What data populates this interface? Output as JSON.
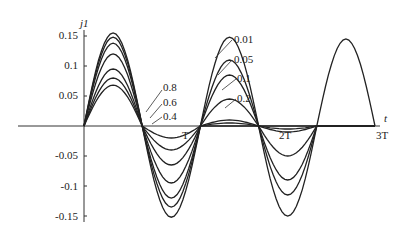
{
  "chart_data": {
    "type": "line",
    "title": "",
    "xlabel": "t",
    "ylabel": "j1",
    "x_ticks": [
      "T",
      "2T",
      "3T"
    ],
    "y_ticks": [
      "0.15",
      "0.1",
      "0.05",
      "-0.05",
      "-0.1",
      "-0.15"
    ],
    "ylim": [
      -0.16,
      0.16
    ],
    "grid": false,
    "legend_position": "inline annotations",
    "series": [
      {
        "name": "0.01",
        "peaks": [
          0.155,
          -0.152,
          0.148,
          -0.15,
          0.145
        ]
      },
      {
        "name": "0.05",
        "peaks": [
          0.148,
          -0.135,
          0.11,
          -0.115,
          0.0
        ]
      },
      {
        "name": "0.1",
        "peaks": [
          0.138,
          -0.12,
          0.085,
          -0.09,
          0.0
        ]
      },
      {
        "name": "0.2",
        "peaks": [
          0.12,
          -0.095,
          0.045,
          -0.05,
          0.0
        ]
      },
      {
        "name": "0.4",
        "peaks": [
          0.095,
          -0.065,
          0.01,
          -0.01,
          0.0
        ]
      },
      {
        "name": "0.6",
        "peaks": [
          0.08,
          -0.04,
          0.005,
          -0.005,
          0.0
        ]
      },
      {
        "name": "0.8",
        "peaks": [
          0.068,
          -0.02,
          0.0,
          0.0,
          0.0
        ]
      }
    ]
  },
  "labels": {
    "ylabel": "j1",
    "xlabel": "t",
    "yticks": [
      "0.15",
      "0.1",
      "0.05",
      "-0.05",
      "-0.1",
      "-0.15"
    ],
    "xticks": [
      "T",
      "2T",
      "3T"
    ],
    "left_legend": [
      "0.8",
      "0.6",
      "0.4"
    ],
    "right_legend": [
      "0.01",
      "0.05",
      "0.1",
      "0.2"
    ]
  }
}
